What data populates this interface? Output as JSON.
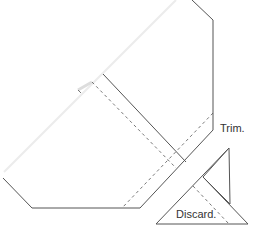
{
  "diagram": {
    "labels": {
      "trim": "Trim.",
      "discard": "Discard."
    },
    "colors": {
      "line": "#555555",
      "fold": "#e8e8e8",
      "text": "#333333"
    }
  }
}
